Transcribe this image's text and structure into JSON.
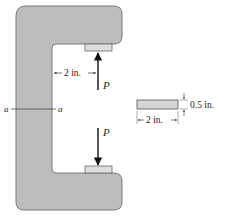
{
  "diagram": {
    "type": "c-clamp-loading",
    "frame": {
      "fill": "#bdbdbd",
      "stroke": "#777777"
    },
    "plates": {
      "fill": "#d9d9d9"
    },
    "loads": [
      {
        "label": "P",
        "direction": "up"
      },
      {
        "label": "P",
        "direction": "down"
      }
    ],
    "dimensions": {
      "throat_offset": "2 in.",
      "section_width": "2 in.",
      "section_thickness": "0.5 in."
    },
    "section_labels": {
      "left": "a",
      "right": "a"
    }
  }
}
